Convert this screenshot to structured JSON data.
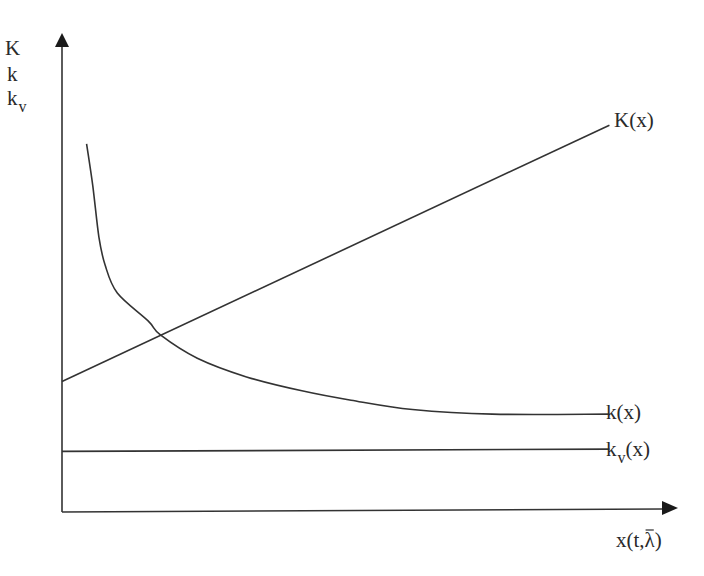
{
  "chart_data": {
    "type": "line",
    "title": "",
    "xlabel": {
      "base": "x(t,",
      "lambda": "λ",
      "close": ")",
      "lambda_overbar": true
    },
    "ylabel": {
      "lines": [
        "K",
        "k",
        "k"
      ],
      "third_subscript": "v"
    },
    "ticks": false,
    "grid": false,
    "xlim": [
      0,
      1
    ],
    "ylim": [
      0,
      1
    ],
    "series": [
      {
        "name": "K(x)",
        "label_base": "K(x)",
        "kind": "increasing-linear",
        "points": [
          [
            0.0,
            0.28
          ],
          [
            0.89,
            0.83
          ]
        ]
      },
      {
        "name": "k(x)",
        "label_base": "k(x)",
        "kind": "decreasing-hyperbolic",
        "points": [
          [
            0.04,
            0.79
          ],
          [
            0.05,
            0.7
          ],
          [
            0.06,
            0.59
          ],
          [
            0.07,
            0.53
          ],
          [
            0.09,
            0.47
          ],
          [
            0.14,
            0.41
          ],
          [
            0.16,
            0.38
          ],
          [
            0.22,
            0.33
          ],
          [
            0.3,
            0.29
          ],
          [
            0.39,
            0.26
          ],
          [
            0.47,
            0.24
          ],
          [
            0.57,
            0.22
          ],
          [
            0.7,
            0.21
          ],
          [
            0.89,
            0.21
          ]
        ]
      },
      {
        "name": "k_v(x)",
        "label_base": "k",
        "label_sub": "v",
        "label_tail": "(x)",
        "kind": "nearly-flat",
        "points": [
          [
            0.0,
            0.13
          ],
          [
            0.89,
            0.135
          ]
        ]
      }
    ],
    "annotations": [
      {
        "type": "intersection",
        "between": [
          "K(x)",
          "k(x)"
        ],
        "at": [
          0.16,
          0.38
        ]
      }
    ]
  }
}
